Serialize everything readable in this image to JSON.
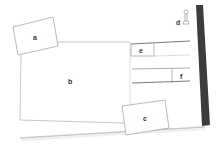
{
  "diagram": {
    "type": "wireframe-sketch",
    "boxes": [
      {
        "id": "a",
        "label": "a"
      },
      {
        "id": "b",
        "label": "b"
      },
      {
        "id": "c",
        "label": "c"
      },
      {
        "id": "d",
        "label": "d"
      },
      {
        "id": "e",
        "label": "e"
      },
      {
        "id": "f",
        "label": "f"
      }
    ],
    "colors": {
      "line": "#b8b8b8",
      "dark_line": "#6a6a6a",
      "binding_strip": "#3c3c3c",
      "label": "#333333",
      "background": "#ffffff"
    }
  }
}
